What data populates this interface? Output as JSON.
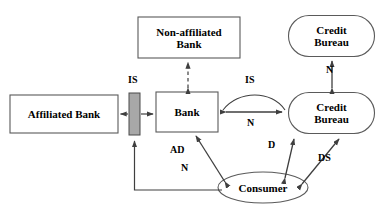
{
  "diagram": {
    "type": "block-flow-diagram",
    "colors": {
      "stroke": "#3f3f3f",
      "text": "#000000",
      "background": "#ffffff",
      "is_bar_fill": "#a8a8a8",
      "node_fill": "#ffffff"
    },
    "nodes": [
      {
        "id": "non-affiliated-bank",
        "label": "Non-affiliated\nBank",
        "shape": "rectangle",
        "x": 138,
        "y": 17,
        "w": 102,
        "h": 41
      },
      {
        "id": "credit-bureau-top",
        "label": "Credit\nBureau",
        "shape": "rounded-rectangle",
        "x": 288,
        "y": 15,
        "w": 87,
        "h": 42
      },
      {
        "id": "affiliated-bank",
        "label": "Affiliated Bank",
        "shape": "rectangle",
        "x": 10,
        "y": 95,
        "w": 108,
        "h": 38
      },
      {
        "id": "is-bar",
        "label": "",
        "shape": "filled-bar",
        "x": 129,
        "y": 93,
        "w": 11,
        "h": 42
      },
      {
        "id": "bank",
        "label": "Bank",
        "shape": "rectangle",
        "x": 156,
        "y": 92,
        "w": 62,
        "h": 40
      },
      {
        "id": "credit-bureau-main",
        "label": "Credit\nBureau",
        "shape": "rounded-rectangle",
        "x": 288,
        "y": 92,
        "w": 87,
        "h": 42
      },
      {
        "id": "consumer",
        "label": "Consumer",
        "shape": "ellipse",
        "x": 218,
        "y": 172,
        "w": 90,
        "h": 31
      }
    ],
    "edge_labels": [
      {
        "id": "is-bar-label",
        "text": "IS",
        "x": 128,
        "y": 74
      },
      {
        "id": "is-arc-label",
        "text": "IS",
        "x": 245,
        "y": 74
      },
      {
        "id": "n-straight-label",
        "text": "N",
        "x": 247,
        "y": 117
      },
      {
        "id": "n-vertical-label",
        "text": "N",
        "x": 326,
        "y": 64
      },
      {
        "id": "ad-label",
        "text": "AD",
        "x": 170,
        "y": 144
      },
      {
        "id": "n-diagonal-label",
        "text": "N",
        "x": 181,
        "y": 162
      },
      {
        "id": "d-label",
        "text": "D",
        "x": 268,
        "y": 139
      },
      {
        "id": "ds-label",
        "text": "DS",
        "x": 318,
        "y": 152
      }
    ],
    "edges": [
      {
        "id": "nonaffiliated-bank-edge",
        "from": "bank",
        "to": "non-affiliated-bank",
        "style": "dashed",
        "heads": "both"
      },
      {
        "id": "affiliated-bank-is-edge",
        "from": "is-bar",
        "to": "affiliated-bank",
        "style": "solid",
        "heads": "single"
      },
      {
        "id": "is-bank-edge",
        "from": "is-bar",
        "to": "bank",
        "style": "solid",
        "heads": "single"
      },
      {
        "id": "bank-creditbureau-is-arc",
        "from": "bank",
        "to": "credit-bureau-main",
        "style": "curved",
        "heads": "both"
      },
      {
        "id": "bank-creditbureau-n-edge",
        "from": "bank",
        "to": "credit-bureau-main",
        "style": "solid",
        "heads": "both"
      },
      {
        "id": "creditbureau-n-vertical",
        "from": "credit-bureau-main",
        "to": "credit-bureau-top",
        "style": "solid",
        "heads": "both"
      },
      {
        "id": "bank-consumer-edge",
        "from": "bank",
        "to": "consumer",
        "style": "solid",
        "heads": "both"
      },
      {
        "id": "consumer-is-feedback-edge",
        "from": "consumer",
        "to": "is-bar",
        "style": "solid",
        "heads": "single"
      },
      {
        "id": "creditbureau-consumer-d",
        "from": "credit-bureau-main",
        "to": "consumer",
        "style": "solid",
        "heads": "both"
      },
      {
        "id": "creditbureau-consumer-ds",
        "from": "credit-bureau-main",
        "to": "consumer",
        "style": "solid",
        "heads": "both"
      }
    ]
  }
}
